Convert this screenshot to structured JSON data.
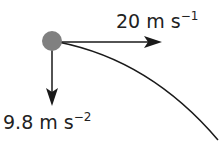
{
  "diagram": {
    "type": "projectile-motion",
    "velocity": {
      "value": "20",
      "unit": "m s",
      "exponent": "−1",
      "direction": "horizontal"
    },
    "acceleration": {
      "value": "9.8",
      "unit": "m s",
      "exponent": "−2",
      "direction": "downward"
    },
    "colors": {
      "ball": "#808080",
      "line": "#1a1a1a"
    }
  }
}
